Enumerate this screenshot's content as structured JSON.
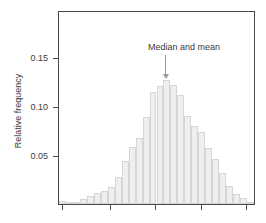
{
  "chart_data": {
    "type": "bar",
    "title": "",
    "subtitle": "",
    "xlabel": "",
    "ylabel": "Relative frequency",
    "ylim": [
      0,
      0.1915
    ],
    "yticks": [
      0.05,
      0.1,
      0.15
    ],
    "ytick_labels": [
      "0.05",
      "0.10",
      "0.15"
    ],
    "xticks_count": 5,
    "xtick_labels": [
      "",
      "",
      "",
      "",
      ""
    ],
    "grid": false,
    "legend": null,
    "bar_color": "#efefef",
    "bar_edge_color": "#d6d6d6",
    "axis_color": "#4a4a4a",
    "text_color": "#3b3b3b",
    "categories": [
      "1",
      "2",
      "3",
      "4",
      "5",
      "6",
      "7",
      "8",
      "9",
      "10",
      "11",
      "12",
      "13",
      "14",
      "15",
      "16",
      "17",
      "18",
      "19",
      "20",
      "21",
      "22",
      "23",
      "24",
      "25",
      "26",
      "27",
      "28"
    ],
    "values": [
      0.003,
      0.0,
      0.002,
      0.005,
      0.008,
      0.011,
      0.013,
      0.017,
      0.027,
      0.043,
      0.057,
      0.066,
      0.087,
      0.112,
      0.118,
      0.124,
      0.119,
      0.109,
      0.088,
      0.078,
      0.072,
      0.056,
      0.045,
      0.031,
      0.018,
      0.01,
      0.006,
      0.002
    ],
    "annotations": [
      {
        "text": "Median and mean",
        "target_value": 0.124,
        "target_category": "16",
        "arrow": "down"
      }
    ]
  },
  "annotation": {
    "label": "Median and mean"
  },
  "axes": {
    "ylabel": "Relative frequency",
    "ytick_0": "0.05",
    "ytick_1": "0.10",
    "ytick_2": "0.15"
  }
}
